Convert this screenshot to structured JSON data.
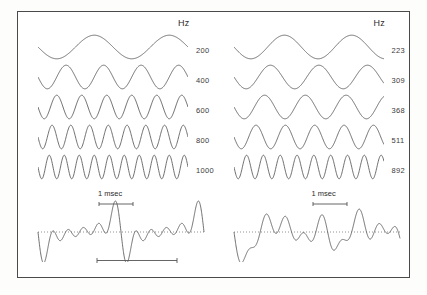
{
  "figure": {
    "title": "",
    "background_color": "#ffffff",
    "border_color": "#4a4a4a",
    "trace_color": "#555555",
    "baseline_color": "#777777"
  },
  "panels": {
    "left": {
      "name": "harmonic-complex-panel",
      "hz_header": "Hz",
      "components": [
        {
          "label": "200",
          "cycles": 2.0
        },
        {
          "label": "400",
          "cycles": 4.0
        },
        {
          "label": "600",
          "cycles": 6.0
        },
        {
          "label": "800",
          "cycles": 8.0
        },
        {
          "label": "1000",
          "cycles": 10.0
        }
      ],
      "time_label": "1 msec",
      "has_scale_bar": true,
      "sum_periodic": true
    },
    "right": {
      "name": "inharmonic-complex-panel",
      "hz_header": "Hz",
      "components": [
        {
          "label": "223",
          "cycles": 2.23
        },
        {
          "label": "309",
          "cycles": 3.09
        },
        {
          "label": "368",
          "cycles": 3.68
        },
        {
          "label": "511",
          "cycles": 5.11
        },
        {
          "label": "892",
          "cycles": 8.92
        }
      ],
      "time_label": "1 msec",
      "has_scale_bar": false,
      "sum_periodic": false
    }
  },
  "chart_data": {
    "type": "line",
    "title": "",
    "xlabel": "",
    "ylabel": "",
    "series": [
      {
        "name": "200 Hz",
        "panel": "left",
        "frequency": 200,
        "cycles_shown": 2.0,
        "amplitude": 1.0
      },
      {
        "name": "400 Hz",
        "panel": "left",
        "frequency": 400,
        "cycles_shown": 4.0,
        "amplitude": 1.0
      },
      {
        "name": "600 Hz",
        "panel": "left",
        "frequency": 600,
        "cycles_shown": 6.0,
        "amplitude": 1.0
      },
      {
        "name": "800 Hz",
        "panel": "left",
        "frequency": 800,
        "cycles_shown": 8.0,
        "amplitude": 1.0
      },
      {
        "name": "1000 Hz",
        "panel": "left",
        "frequency": 1000,
        "cycles_shown": 10.0,
        "amplitude": 1.0
      },
      {
        "name": "223 Hz",
        "panel": "right",
        "frequency": 223,
        "cycles_shown": 2.23,
        "amplitude": 1.0
      },
      {
        "name": "309 Hz",
        "panel": "right",
        "frequency": 309,
        "cycles_shown": 3.09,
        "amplitude": 1.0
      },
      {
        "name": "368 Hz",
        "panel": "right",
        "frequency": 368,
        "cycles_shown": 3.68,
        "amplitude": 1.0
      },
      {
        "name": "511 Hz",
        "panel": "right",
        "frequency": 511,
        "cycles_shown": 5.11,
        "amplitude": 1.0
      },
      {
        "name": "892 Hz",
        "panel": "right",
        "frequency": 892,
        "cycles_shown": 8.92,
        "amplitude": 1.0
      }
    ],
    "axis_time_span_ms": 10,
    "time_marker": "1 msec",
    "grid": false,
    "legend": "right-of-each-trace"
  },
  "geometry": {
    "wave_width": 150,
    "wave_height": 26,
    "row_tops": [
      22,
      52,
      82,
      112,
      142
    ],
    "label_tops": [
      34,
      64,
      94,
      124,
      154
    ],
    "wave_left": 20,
    "label_left": 178,
    "hz_head_top": 8,
    "hz_head_left": 177,
    "complex_top": 182,
    "complex_width": 172,
    "complex_height": 70,
    "msec_label_top": 178,
    "msec_label_left": 88,
    "msec_bar_top": 190,
    "msec_bar_left": 88,
    "scale_bar_top": 246,
    "scale_bar_left": 80
  }
}
